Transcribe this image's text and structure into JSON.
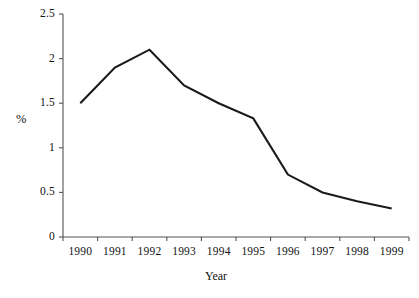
{
  "chart_data": {
    "type": "line",
    "title": "",
    "subtitle": "",
    "xlabel": "Year",
    "ylabel": "%",
    "categories": [
      "1990",
      "1991",
      "1992",
      "1993",
      "1994",
      "1995",
      "1996",
      "1997",
      "1998",
      "1999"
    ],
    "x": [
      1990,
      1991,
      1992,
      1993,
      1994,
      1995,
      1996,
      1997,
      1998,
      1999
    ],
    "values": [
      1.5,
      1.9,
      2.1,
      1.7,
      1.5,
      1.33,
      0.7,
      0.5,
      0.4,
      0.32
    ],
    "series": [
      {
        "name": "",
        "values": [
          1.5,
          1.9,
          2.1,
          1.7,
          1.5,
          1.33,
          0.7,
          0.5,
          0.4,
          0.32
        ],
        "color": "#1a1a1a"
      }
    ],
    "ylim": [
      0,
      2.5
    ],
    "yticks": [
      0,
      0.5,
      1,
      1.5,
      2,
      2.5
    ],
    "ytick_labels": [
      "0",
      "0.5",
      "1",
      "1.5",
      "2",
      "2.5"
    ],
    "xtick_labels": [
      "1990",
      "1991",
      "1992",
      "1993",
      "1994",
      "1995",
      "1996",
      "1997",
      "1998",
      "1999"
    ],
    "grid": false,
    "legend": "none",
    "line_color": "#1a1a1a",
    "axis_color": "#555555",
    "background": "#ffffff",
    "markers": false
  }
}
